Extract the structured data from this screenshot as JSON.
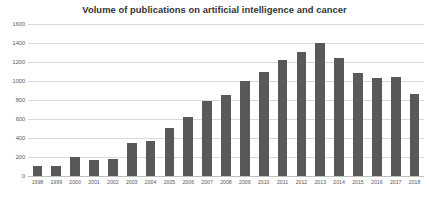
{
  "chart_data": {
    "type": "bar",
    "title": "Volume of publications on artificial intelligence and cancer",
    "xlabel": "",
    "ylabel": "",
    "ylim": [
      0,
      1600
    ],
    "yticks": [
      0,
      200,
      400,
      600,
      800,
      1000,
      1200,
      1400,
      1600
    ],
    "ytick_labels": [
      "0",
      "200",
      "400",
      "600",
      "800",
      "1000",
      "1200",
      "1400",
      "1600"
    ],
    "grid": true,
    "legend": false,
    "legend_position": "none",
    "bar_color": "#595959",
    "gridline_color": "#d9d9d9",
    "background_color": "#ffffff",
    "categories": [
      "1998",
      "1999",
      "2000",
      "2001",
      "2002",
      "2003",
      "2004",
      "2005",
      "2006",
      "2007",
      "2008",
      "2009",
      "2010",
      "2011",
      "2012",
      "2013",
      "2014",
      "2015",
      "2016",
      "2017",
      "2018"
    ],
    "values": [
      110,
      110,
      200,
      170,
      180,
      350,
      370,
      510,
      620,
      790,
      850,
      1000,
      1090,
      1220,
      1310,
      1400,
      1240,
      1080,
      1030,
      1040,
      860
    ]
  }
}
